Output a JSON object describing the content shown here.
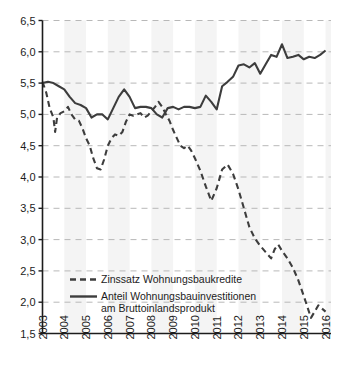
{
  "chart_data": {
    "type": "line",
    "title": "",
    "subtitle": "",
    "xlabel": "",
    "ylabel": "",
    "xlim": [
      2003,
      2016.25
    ],
    "ylim": [
      1.5,
      6.5
    ],
    "grid": true,
    "grid_style": "dashed-horizontal",
    "legend_position": "inside-bottom-left",
    "yticks": [
      "1,5",
      "2,0",
      "2,5",
      "3,0",
      "3,5",
      "4,0",
      "4,5",
      "5,0",
      "5,5",
      "6,0",
      "6,5"
    ],
    "ytick_values": [
      1.5,
      2.0,
      2.5,
      3.0,
      3.5,
      4.0,
      4.5,
      5.0,
      5.5,
      6.0,
      6.5
    ],
    "categories": [
      "2003",
      "2004",
      "2005",
      "2006",
      "2007",
      "2008",
      "2009",
      "2010",
      "2011",
      "2012",
      "2013",
      "2014",
      "2015",
      "2016"
    ],
    "xtick_values": [
      2003,
      2004,
      2005,
      2006,
      2007,
      2008,
      2009,
      2010,
      2011,
      2012,
      2013,
      2014,
      2015,
      2016
    ],
    "series": [
      {
        "name": "Zinssatz Wohnungsbaukredite",
        "style": "dashed",
        "color": "#3d3d3d",
        "x": [
          2003.0,
          2003.17,
          2003.33,
          2003.5,
          2003.58,
          2003.67,
          2003.83,
          2004.0,
          2004.17,
          2004.33,
          2004.5,
          2004.67,
          2004.83,
          2005.0,
          2005.17,
          2005.33,
          2005.5,
          2005.67,
          2005.83,
          2006.0,
          2006.17,
          2006.33,
          2006.5,
          2006.67,
          2006.83,
          2007.0,
          2007.17,
          2007.33,
          2007.5,
          2007.67,
          2007.83,
          2008.0,
          2008.17,
          2008.33,
          2008.5,
          2008.67,
          2008.83,
          2009.0,
          2009.17,
          2009.33,
          2009.5,
          2009.67,
          2009.83,
          2010.0,
          2010.25,
          2010.5,
          2010.75,
          2011.0,
          2011.25,
          2011.5,
          2011.75,
          2012.0,
          2012.25,
          2012.5,
          2012.75,
          2013.0,
          2013.25,
          2013.5,
          2013.67,
          2013.83,
          2014.0,
          2014.25,
          2014.5,
          2014.75,
          2015.0,
          2015.17,
          2015.33,
          2015.5,
          2015.67,
          2015.83,
          2016.0
        ],
        "values": [
          5.52,
          5.35,
          5.1,
          4.95,
          4.72,
          4.95,
          5.02,
          5.05,
          5.12,
          5.0,
          4.92,
          4.9,
          4.78,
          4.62,
          4.5,
          4.3,
          4.14,
          4.12,
          4.28,
          4.5,
          4.62,
          4.68,
          4.66,
          4.72,
          4.88,
          5.0,
          4.98,
          5.0,
          5.02,
          4.95,
          4.98,
          5.05,
          5.12,
          5.2,
          5.12,
          5.0,
          4.9,
          4.75,
          4.62,
          4.5,
          4.46,
          4.5,
          4.42,
          4.3,
          4.1,
          3.85,
          3.62,
          3.82,
          4.12,
          4.2,
          4.05,
          3.8,
          3.5,
          3.2,
          3.02,
          2.9,
          2.8,
          2.7,
          2.85,
          2.92,
          2.82,
          2.7,
          2.55,
          2.35,
          2.1,
          1.92,
          1.75,
          1.85,
          1.95,
          1.9,
          1.85
        ]
      },
      {
        "name": "Anteil Wohnungsbauinvestitionen am Bruttoinlandsprodukt",
        "style": "solid",
        "color": "#3d3d3d",
        "x": [
          2003.0,
          2003.25,
          2003.5,
          2003.75,
          2004.0,
          2004.25,
          2004.5,
          2004.75,
          2005.0,
          2005.25,
          2005.5,
          2005.75,
          2006.0,
          2006.25,
          2006.5,
          2006.75,
          2007.0,
          2007.25,
          2007.5,
          2007.75,
          2008.0,
          2008.25,
          2008.5,
          2008.75,
          2009.0,
          2009.25,
          2009.5,
          2009.75,
          2010.0,
          2010.25,
          2010.5,
          2010.75,
          2011.0,
          2011.25,
          2011.5,
          2011.75,
          2012.0,
          2012.25,
          2012.5,
          2012.75,
          2013.0,
          2013.25,
          2013.5,
          2013.75,
          2014.0,
          2014.25,
          2014.5,
          2014.75,
          2015.0,
          2015.25,
          2015.5,
          2015.75,
          2016.0
        ],
        "values": [
          5.5,
          5.52,
          5.5,
          5.45,
          5.4,
          5.28,
          5.18,
          5.15,
          5.1,
          4.95,
          5.0,
          5.0,
          4.92,
          5.1,
          5.28,
          5.4,
          5.28,
          5.1,
          5.12,
          5.12,
          5.1,
          5.0,
          4.95,
          5.1,
          5.12,
          5.08,
          5.12,
          5.12,
          5.1,
          5.12,
          5.3,
          5.2,
          5.08,
          5.45,
          5.52,
          5.6,
          5.78,
          5.8,
          5.75,
          5.82,
          5.65,
          5.8,
          5.95,
          5.92,
          6.12,
          5.9,
          5.92,
          5.95,
          5.88,
          5.92,
          5.9,
          5.95,
          6.02
        ]
      }
    ]
  },
  "legend": {
    "entries": [
      {
        "label": "Zinssatz Wohnungsbaukredite",
        "style": "dashed"
      },
      {
        "label": "Anteil Wohnungsbauinvestitionen",
        "label2": "am Bruttoinlandsprodukt",
        "style": "solid"
      }
    ]
  },
  "colors": {
    "line": "#3d3d3d",
    "axis": "#1c1c1c",
    "grid": "#b8b8b8",
    "band": "#f4f4f4",
    "background": "#ffffff",
    "text": "#1c1c1c"
  }
}
